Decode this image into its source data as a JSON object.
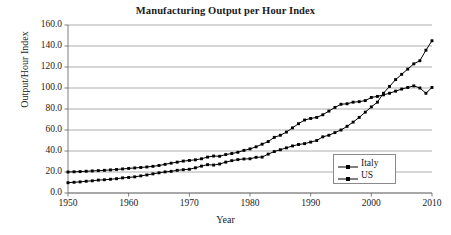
{
  "chart_data": {
    "type": "line",
    "title": "Manufacturing Output per Hour Index",
    "xlabel": "Year",
    "ylabel": "Output/Hour Index",
    "xlim": [
      1950,
      2010
    ],
    "ylim": [
      0.0,
      160.0
    ],
    "grid": true,
    "grid_axis": "y",
    "legend_position": "bottom-right",
    "y_ticks": [
      "0.0",
      "20.0",
      "40.0",
      "60.0",
      "80.0",
      "100.0",
      "120.0",
      "140.0",
      "160.0"
    ],
    "y_tick_values": [
      0,
      20,
      40,
      60,
      80,
      100,
      120,
      140,
      160
    ],
    "x_ticks": [
      "1950",
      "1960",
      "1970",
      "1980",
      "1990",
      "2000",
      "2010"
    ],
    "x_tick_values": [
      1950,
      1960,
      1970,
      1980,
      1990,
      2000,
      2010
    ],
    "x": [
      1950,
      1951,
      1952,
      1953,
      1954,
      1955,
      1956,
      1957,
      1958,
      1959,
      1960,
      1961,
      1962,
      1963,
      1964,
      1965,
      1966,
      1967,
      1968,
      1969,
      1970,
      1971,
      1972,
      1973,
      1974,
      1975,
      1976,
      1977,
      1978,
      1979,
      1980,
      1981,
      1982,
      1983,
      1984,
      1985,
      1986,
      1987,
      1988,
      1989,
      1990,
      1991,
      1992,
      1993,
      1994,
      1995,
      1996,
      1997,
      1998,
      1999,
      2000,
      2001,
      2002,
      2003,
      2004,
      2005,
      2006,
      2007,
      2008,
      2009,
      2010
    ],
    "series": [
      {
        "name": "Italy",
        "marker": "square",
        "color": "#000000",
        "values": [
          20.0,
          20.2,
          20.4,
          20.7,
          21.0,
          21.3,
          21.6,
          22.0,
          22.4,
          22.9,
          23.4,
          23.9,
          24.3,
          24.8,
          25.4,
          26.2,
          27.3,
          28.4,
          29.4,
          30.4,
          31.0,
          31.6,
          32.6,
          34.2,
          35.2,
          35.0,
          36.6,
          37.6,
          38.8,
          40.6,
          42.0,
          44.0,
          46.5,
          49.0,
          53.0,
          55.0,
          58.0,
          62.0,
          66.0,
          69.5,
          71.0,
          72.0,
          74.5,
          78.0,
          81.5,
          84.5,
          85.0,
          86.5,
          87.0,
          88.0,
          91.0,
          92.0,
          93.5,
          95.0,
          97.0,
          99.0,
          100.5,
          102.0,
          100.0,
          95.0,
          100.5
        ]
      },
      {
        "name": "US",
        "marker": "square",
        "color": "#000000",
        "values": [
          9.8,
          10.2,
          10.6,
          11.2,
          11.6,
          12.3,
          12.6,
          13.1,
          13.6,
          14.4,
          14.8,
          15.4,
          16.3,
          17.2,
          18.2,
          19.2,
          20.1,
          20.6,
          21.6,
          22.2,
          22.6,
          24.0,
          25.6,
          27.0,
          26.6,
          27.6,
          29.4,
          30.8,
          31.8,
          32.4,
          32.6,
          34.0,
          34.2,
          37.0,
          39.5,
          41.2,
          43.0,
          44.8,
          46.2,
          47.0,
          48.5,
          50.0,
          53.5,
          55.0,
          57.5,
          60.0,
          63.5,
          67.5,
          72.0,
          77.0,
          82.0,
          86.5,
          95.0,
          101.5,
          108.0,
          113.0,
          118.0,
          123.0,
          126.0,
          136.0,
          145.0
        ]
      }
    ]
  },
  "plot_geometry": {
    "left": 68,
    "right": 432,
    "top": 25,
    "bottom": 193
  },
  "legend": {
    "items": [
      {
        "label": "Italy"
      },
      {
        "label": "US"
      }
    ]
  }
}
